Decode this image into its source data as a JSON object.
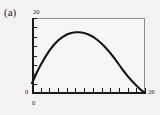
{
  "figure": {
    "panel_label": "(a)",
    "background_color": "#f4f2f0",
    "frame_color": "#1a1a1a",
    "curve_color": "#151515"
  },
  "axes": {
    "y_max_label": "20",
    "y_min_label": "0",
    "x_min_label": "0",
    "x_max_label": "26"
  },
  "chart_data": {
    "type": "line",
    "title": "(a)",
    "xlabel": "",
    "ylabel": "",
    "xlim": [
      0,
      26
    ],
    "ylim": [
      0,
      20
    ],
    "grid": false,
    "legend": null,
    "xticks": [
      0,
      2,
      4,
      6,
      8,
      10,
      12,
      14,
      16,
      18,
      20,
      22,
      24,
      26
    ],
    "xtick_labels": [
      "0",
      "",
      "",
      "",
      "",
      "",
      "",
      "",
      "",
      "",
      "",
      "",
      "",
      "26"
    ],
    "yticks": [
      0,
      2.5,
      5,
      7.5,
      10,
      12.5,
      15,
      17.5,
      20
    ],
    "ytick_labels": [
      "0",
      "",
      "",
      "",
      "",
      "",
      "",
      "",
      "20"
    ],
    "series": [
      {
        "name": "curve",
        "x": [
          0,
          1,
          2,
          3,
          4,
          5,
          6,
          7,
          8,
          9,
          10,
          11,
          12,
          13,
          14,
          15,
          16,
          17,
          18,
          19,
          20,
          21,
          22,
          23,
          24,
          25,
          26
        ],
        "y": [
          2.6,
          5.2,
          7.5,
          9.5,
          11.3,
          12.8,
          14.0,
          14.9,
          15.6,
          16.0,
          16.2,
          16.2,
          16.0,
          15.6,
          15.0,
          14.2,
          13.2,
          12.0,
          10.7,
          9.2,
          7.6,
          6.0,
          4.5,
          3.2,
          2.0,
          0.9,
          0.0
        ]
      }
    ],
    "annotations": []
  }
}
